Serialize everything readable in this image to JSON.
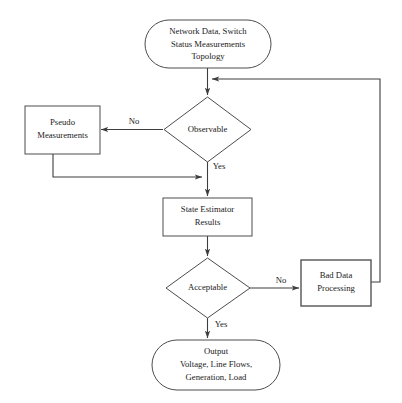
{
  "diagram": {
    "background_color": "#ffffff",
    "stroke_color": "#3d3d3d",
    "text_color": "#1a1a1a",
    "nodes": {
      "input": {
        "type": "terminal",
        "line1": "Network Data, Switch",
        "line2": "Status Measurements",
        "line3": "Topology"
      },
      "observable": {
        "type": "decision",
        "label": "Observable"
      },
      "pseudo": {
        "type": "process",
        "line1": "Pseudo",
        "line2": "Measurements"
      },
      "state_estimator": {
        "type": "process",
        "line1": "State Estimator",
        "line2": "Results"
      },
      "acceptable": {
        "type": "decision",
        "label": "Acceptable"
      },
      "bad_data": {
        "type": "process",
        "line1": "Bad Data",
        "line2": "Processing"
      },
      "output": {
        "type": "terminal",
        "line1": "Output",
        "line2": "Voltage, Line Flows,",
        "line3": "Generation, Load"
      }
    },
    "edge_labels": {
      "observable_no": "No",
      "observable_yes": "Yes",
      "acceptable_no": "No",
      "acceptable_yes": "Yes"
    }
  }
}
